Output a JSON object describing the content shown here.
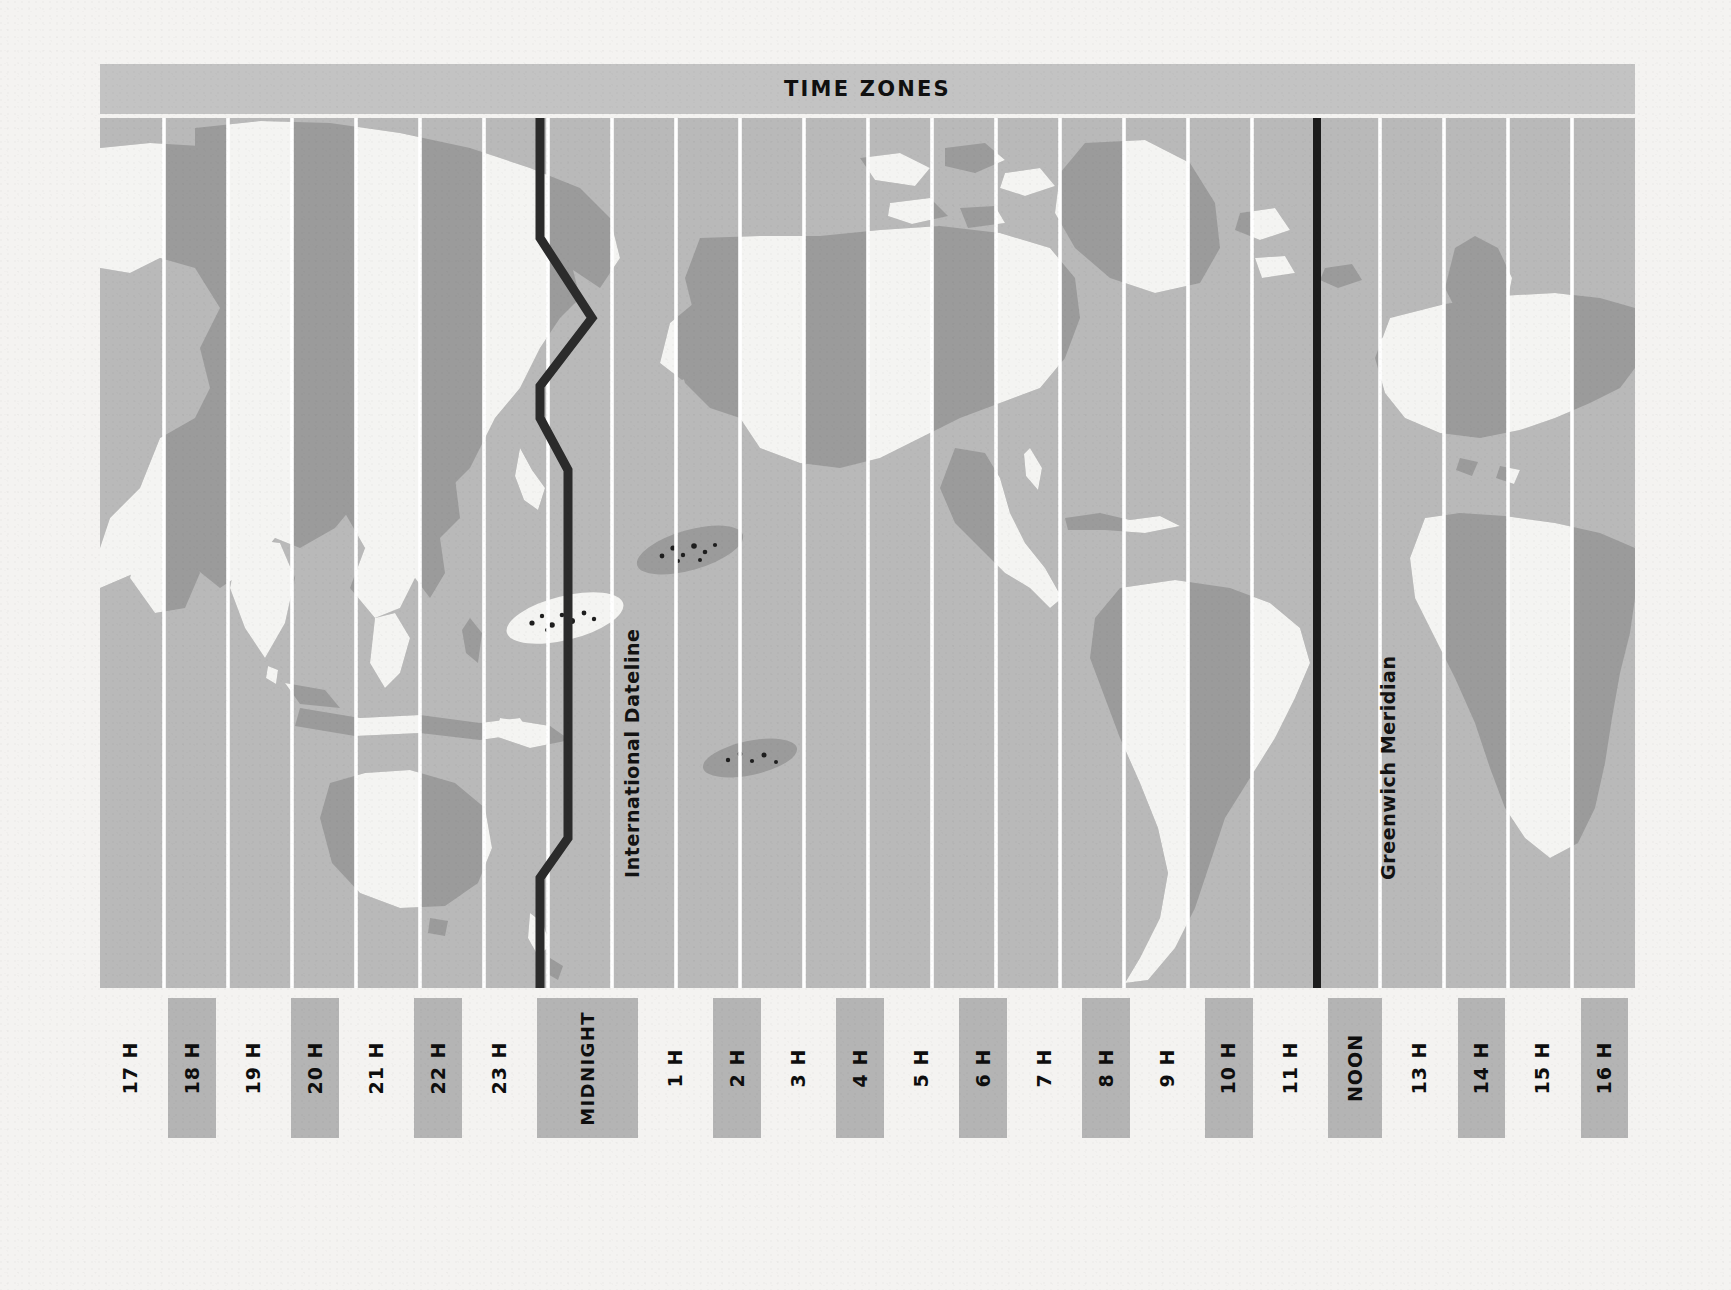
{
  "title": "TIME ZONES",
  "map": {
    "dateline_label": "International Dateline",
    "greenwich_label": "Greenwich Meridian"
  },
  "colors": {
    "paper": "#f4f3f1",
    "title_band": "#c3c3c3",
    "ocean": "#b9b9b9",
    "land_light": "#f4f4f2",
    "land_dark": "#9a9a9a",
    "zone_line": "#ffffff",
    "dateline": "#2b2b2b",
    "meridian": "#1c1c1c",
    "hour_block": "#b4b4b4",
    "text": "#101010"
  },
  "hours": [
    {
      "label": "17 H",
      "shaded": false
    },
    {
      "label": "18 H",
      "shaded": true
    },
    {
      "label": "19 H",
      "shaded": false
    },
    {
      "label": "20 H",
      "shaded": true
    },
    {
      "label": "21 H",
      "shaded": false
    },
    {
      "label": "22 H",
      "shaded": true
    },
    {
      "label": "23 H",
      "shaded": false
    },
    {
      "label": "MIDNIGHT",
      "shaded": true
    },
    {
      "label": "1 H",
      "shaded": false
    },
    {
      "label": "2 H",
      "shaded": true
    },
    {
      "label": "3 H",
      "shaded": false
    },
    {
      "label": "4 H",
      "shaded": true
    },
    {
      "label": "5 H",
      "shaded": false
    },
    {
      "label": "6 H",
      "shaded": true
    },
    {
      "label": "7 H",
      "shaded": false
    },
    {
      "label": "8 H",
      "shaded": true
    },
    {
      "label": "9 H",
      "shaded": false
    },
    {
      "label": "10 H",
      "shaded": true
    },
    {
      "label": "11 H",
      "shaded": false
    },
    {
      "label": "NOON",
      "shaded": true
    },
    {
      "label": "13 H",
      "shaded": false
    },
    {
      "label": "14 H",
      "shaded": true
    },
    {
      "label": "15 H",
      "shaded": false
    },
    {
      "label": "16 H",
      "shaded": true
    }
  ]
}
